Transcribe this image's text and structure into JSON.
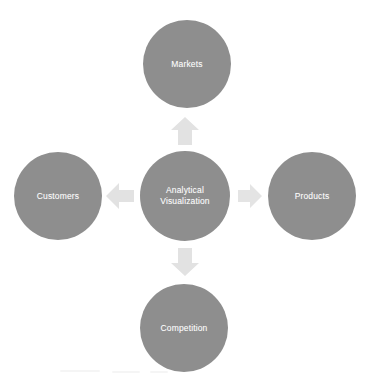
{
  "diagram": {
    "background_color": "#ffffff",
    "node_color": "#8e8e8e",
    "node_text_color": "#ffffff",
    "arrow_color": "#e2e2e2",
    "center": {
      "id": "analytical-visualization",
      "label": "Analytical\nVisualization",
      "cx": 185,
      "cy": 196,
      "r": 45
    },
    "nodes": [
      {
        "id": "markets",
        "label": "Markets",
        "position": "top",
        "cx": 187,
        "cy": 64,
        "r": 44
      },
      {
        "id": "customers",
        "label": "Customers",
        "position": "left",
        "cx": 58,
        "cy": 196,
        "r": 44
      },
      {
        "id": "products",
        "label": "Products",
        "position": "right",
        "cx": 312,
        "cy": 196,
        "r": 44
      },
      {
        "id": "competition",
        "label": "Competition",
        "position": "bottom",
        "cx": 184,
        "cy": 328,
        "r": 44
      }
    ],
    "arrows": [
      {
        "id": "arrow-up",
        "direction": "up",
        "from": "analytical-visualization",
        "to": "markets",
        "x": 170,
        "y": 116,
        "w": 30,
        "h": 30
      },
      {
        "id": "arrow-left",
        "direction": "left",
        "from": "analytical-visualization",
        "to": "customers",
        "x": 105,
        "y": 182,
        "w": 30,
        "h": 28
      },
      {
        "id": "arrow-right",
        "direction": "right",
        "from": "analytical-visualization",
        "to": "products",
        "x": 237,
        "y": 183,
        "w": 26,
        "h": 26
      },
      {
        "id": "arrow-down",
        "direction": "down",
        "from": "analytical-visualization",
        "to": "competition",
        "x": 170,
        "y": 247,
        "w": 30,
        "h": 30
      }
    ]
  }
}
